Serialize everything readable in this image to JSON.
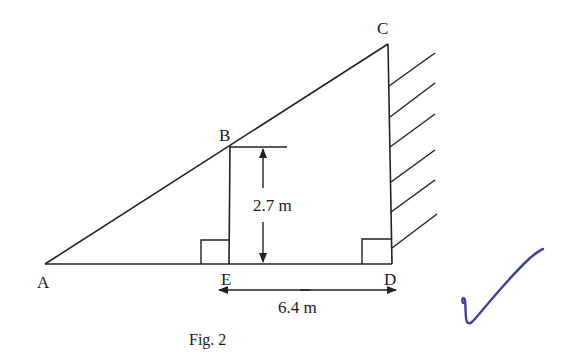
{
  "figure": {
    "caption": "Fig. 2",
    "points": {
      "A": {
        "label": "A",
        "x": 45,
        "y": 264
      },
      "B": {
        "label": "B",
        "x": 230,
        "y": 146
      },
      "C": {
        "label": "C",
        "x": 388,
        "y": 44
      },
      "D": {
        "label": "D",
        "x": 392,
        "y": 264
      },
      "E": {
        "label": "E",
        "x": 229,
        "y": 264
      }
    },
    "dimensions": {
      "BE": {
        "label": "2.7 m",
        "value": 2.7,
        "unit": "m"
      },
      "ED": {
        "label": "6.4 m",
        "value": 6.4,
        "unit": "m"
      }
    },
    "right_angles": [
      "E",
      "D"
    ],
    "wall_hatch_count": 6,
    "annotation": {
      "type": "check-mark",
      "color": "#3f3fa0"
    },
    "colors": {
      "line": "#222222",
      "ink": "#3f3fa0",
      "background": "#ffffff"
    }
  }
}
